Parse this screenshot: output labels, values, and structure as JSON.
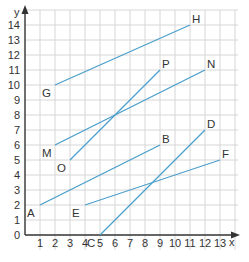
{
  "chart_data": {
    "type": "line",
    "title": "",
    "xlabel": "x",
    "ylabel": "y",
    "xlim": [
      0,
      13
    ],
    "ylim": [
      0,
      14
    ],
    "grid": true,
    "x_ticks": [
      "0",
      "1",
      "2",
      "3",
      "4",
      "5",
      "6",
      "7",
      "8",
      "9",
      "10",
      "11",
      "12",
      "13"
    ],
    "y_ticks": [
      "0",
      "1",
      "2",
      "3",
      "4",
      "5",
      "6",
      "7",
      "8",
      "9",
      "10",
      "11",
      "12",
      "13",
      "14"
    ],
    "segments": [
      {
        "name": "GH",
        "from": {
          "label": "G",
          "x": 2,
          "y": 10
        },
        "to": {
          "label": "H",
          "x": 11,
          "y": 14
        }
      },
      {
        "name": "MN",
        "from": {
          "label": "M",
          "x": 2,
          "y": 6
        },
        "to": {
          "label": "N",
          "x": 12,
          "y": 11
        }
      },
      {
        "name": "OP",
        "from": {
          "label": "O",
          "x": 3,
          "y": 5
        },
        "to": {
          "label": "P",
          "x": 9,
          "y": 11
        }
      },
      {
        "name": "AB",
        "from": {
          "label": "A",
          "x": 1,
          "y": 2
        },
        "to": {
          "label": "B",
          "x": 9,
          "y": 6
        }
      },
      {
        "name": "EF",
        "from": {
          "label": "E",
          "x": 4,
          "y": 2
        },
        "to": {
          "label": "F",
          "x": 13,
          "y": 5
        }
      },
      {
        "name": "CD",
        "from": {
          "label": "C",
          "x": 5,
          "y": 0
        },
        "to": {
          "label": "D",
          "x": 12,
          "y": 7
        }
      }
    ]
  },
  "colors": {
    "segment": "#4a9fcb",
    "grid": "#d6d6d6",
    "axis": "#333333",
    "text": "#333333"
  },
  "axes": {
    "x_label": "x",
    "y_label": "y"
  }
}
